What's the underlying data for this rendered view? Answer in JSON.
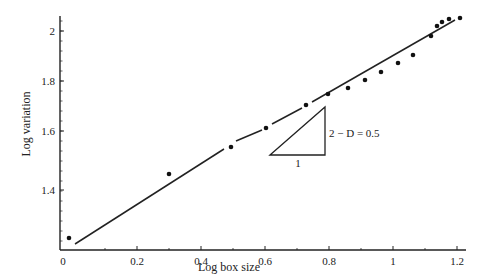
{
  "chart_data": {
    "type": "scatter",
    "title": "",
    "xlabel": "Log box size",
    "ylabel": "Log variation",
    "xlim": [
      -0.04,
      1.24
    ],
    "ylim": [
      1.28,
      2.06
    ],
    "xticks": [
      0,
      0.2,
      0.4,
      0.6,
      0.8,
      1,
      1.2
    ],
    "xtick_labels": [
      "0",
      "0.2",
      "0.4",
      "0.6",
      "0.8",
      "1",
      "1.2"
    ],
    "yticks": [
      1.4,
      1.6,
      1.8,
      2.0
    ],
    "ytick_labels": [
      "1.4",
      "1.6",
      "1.8",
      "2"
    ],
    "grid": false,
    "legend": null,
    "series": [
      {
        "name": "data",
        "kind": "points",
        "x": [
          0.02,
          0.3,
          0.5,
          0.6,
          0.73,
          0.79,
          0.86,
          0.91,
          0.96,
          1.01,
          1.06,
          1.12,
          1.14,
          1.16,
          1.18,
          1.21
        ],
        "y": [
          1.22,
          1.45,
          1.54,
          1.61,
          1.7,
          1.75,
          1.77,
          1.8,
          1.84,
          1.87,
          1.9,
          1.98,
          2.02,
          2.03,
          2.05,
          2.05
        ]
      },
      {
        "name": "fit",
        "kind": "line",
        "x": [
          0.03,
          1.19
        ],
        "y": [
          1.22,
          2.04
        ]
      }
    ],
    "annotations": [
      {
        "type": "slope-triangle",
        "run_label": "1",
        "rise_label": "2 − D = 0.5"
      }
    ]
  }
}
